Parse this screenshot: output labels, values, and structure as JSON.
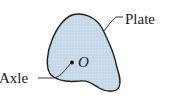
{
  "diagram": {
    "type": "rigid-body-rotation",
    "labels": {
      "plate": "Plate",
      "axle": "Axle",
      "origin": "O"
    },
    "colors": {
      "plate_fill": "#c9dbea",
      "plate_stroke": "#1f1f1f",
      "text": "#1a1a1a",
      "background": "#ffffff"
    }
  }
}
